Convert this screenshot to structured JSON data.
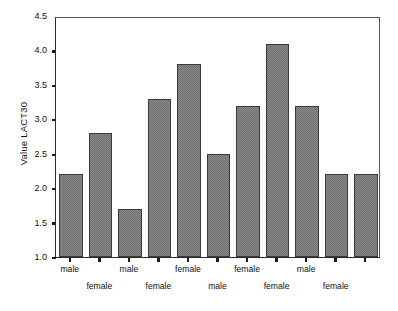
{
  "chart_data": {
    "type": "bar",
    "title": "",
    "subtitle": "",
    "xlabel": "",
    "ylabel": "Value LACT30",
    "ylim": [
      1.0,
      4.5
    ],
    "ytick_labels": [
      "4.5",
      "4.0",
      "3.5",
      "3.0",
      "2.5",
      "2.0",
      "1.5",
      "1.0"
    ],
    "ytick_values": [
      4.5,
      4.0,
      3.5,
      3.0,
      2.5,
      2.0,
      1.5,
      1.0
    ],
    "grid": false,
    "legend": "none",
    "categories": [
      "male",
      "female",
      "male",
      "female",
      "female",
      "male",
      "female",
      "female",
      "male",
      "male",
      "female"
    ],
    "values": [
      2.2,
      2.8,
      1.7,
      3.3,
      3.8,
      2.5,
      3.2,
      4.1,
      3.2,
      2.2,
      2.2
    ],
    "bars": [
      {
        "label": "male",
        "row": "top",
        "value": 2.2
      },
      {
        "label": "female",
        "row": "bottom",
        "value": 2.8
      },
      {
        "label": "male",
        "row": "top",
        "value": 1.7
      },
      {
        "label": "female",
        "row": "bottom",
        "value": 3.3
      },
      {
        "label": "female",
        "row": "top",
        "value": 3.8
      },
      {
        "label": "male",
        "row": "bottom",
        "value": 2.5
      },
      {
        "label": "female",
        "row": "top",
        "value": 3.2
      },
      {
        "label": "female",
        "row": "bottom",
        "value": 4.1
      },
      {
        "label": "male",
        "row": "top",
        "value": 3.2
      },
      {
        "label": "female",
        "row": "bottom",
        "value": 2.2
      },
      {
        "label": "",
        "row": "none",
        "value": 2.2
      }
    ],
    "colors": {
      "bar_fill": "#8a8a8a",
      "bar_pattern": "#6f6f6f",
      "bar_border": "#3a3a3a",
      "axis": "#1a1a1a",
      "frame": "#555555",
      "background": "#ffffff",
      "text": "#111111"
    }
  }
}
